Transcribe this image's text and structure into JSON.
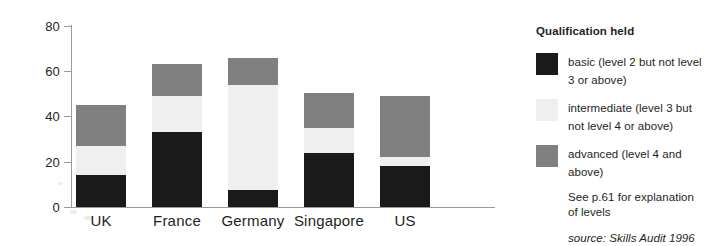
{
  "chart_data": {
    "type": "bar",
    "subtype": "stacked-bar",
    "title": "",
    "xlabel": "",
    "ylabel": "",
    "ylim": [
      0,
      80
    ],
    "yticks": [
      0,
      20,
      40,
      60,
      80
    ],
    "ytick_labels": [
      "0",
      "20",
      "40",
      "60",
      "80"
    ],
    "grid": false,
    "legend_position": "right",
    "categories": [
      "UK",
      "France",
      "Germany",
      "Singapore",
      "US"
    ],
    "series": [
      {
        "name": "basic (level 2 but not level 3 or above)",
        "color": "#1a1a1a",
        "values": [
          14,
          33,
          7.5,
          24,
          18
        ]
      },
      {
        "name": "intermediate (level 3 but not level 4 or above)",
        "color": "#efefef",
        "values": [
          13,
          16,
          46.5,
          11,
          4
        ]
      },
      {
        "name": "advanced (level 4 and above)",
        "color": "#808080",
        "values": [
          18,
          14,
          12,
          15.5,
          27
        ]
      }
    ],
    "totals": [
      45,
      63,
      66,
      50.5,
      49
    ]
  },
  "axis": {
    "y_ticks": [
      {
        "label": "80",
        "value": 80
      },
      {
        "label": "60",
        "value": 60
      },
      {
        "label": "40",
        "value": 40
      },
      {
        "label": "20",
        "value": 20
      },
      {
        "label": "0",
        "value": 0
      }
    ],
    "x_labels": [
      "UK",
      "France",
      "Germany",
      "Singapore",
      "US"
    ]
  },
  "legend": {
    "title": "Qualification held",
    "items": [
      {
        "swatch": "basic-swatch",
        "color": "#1a1a1a",
        "label": "basic (level 2 but not level 3 or above)"
      },
      {
        "swatch": "intermediate-swatch",
        "color": "#efefef",
        "label": "intermediate (level 3 but not level 4 or above)"
      },
      {
        "swatch": "advanced-swatch",
        "color": "#808080",
        "label": "advanced (level 4 and above)"
      }
    ],
    "note": "See p.61 for explanation of levels",
    "source_label": "source:",
    "source_value": "Skills Audit 1996"
  }
}
